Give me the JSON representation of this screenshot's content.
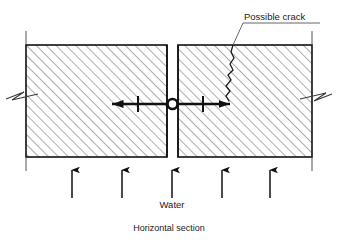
{
  "figure": {
    "title_caption": "Horizontal section",
    "annotations": {
      "crack_label": "Possible crack",
      "water_label": "Water"
    },
    "colors": {
      "line": "#1a1a1a",
      "hatch": "#4a4a4a",
      "background": "#ffffff",
      "text": "#1a1a1a"
    },
    "elements": {
      "left_block_name": "concrete-block-left",
      "right_block_name": "concrete-block-right",
      "joint_name": "construction-joint",
      "waterstop_name": "waterstop-circle",
      "crack_name": "possible-crack-line"
    },
    "counts": {
      "water_pressure_arrows": 5,
      "dimension_arrows": 2,
      "break_symbols": 2
    },
    "geometry": {
      "left_block": {
        "x": 26,
        "y": 45,
        "w": 141,
        "h": 112
      },
      "right_block": {
        "x": 178,
        "y": 45,
        "w": 134,
        "h": 112
      },
      "joint_gap": {
        "x": 167,
        "w": 11
      },
      "waterstop": {
        "cx": 172.5,
        "cy": 104,
        "r": 5
      },
      "arrow_row_y": 104,
      "water_arrow_xs": [
        72,
        122,
        172,
        222,
        270
      ],
      "water_arrow_top_y": 170,
      "water_arrow_bottom_y": 198
    }
  }
}
